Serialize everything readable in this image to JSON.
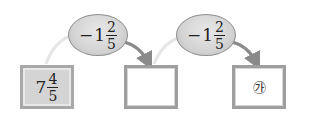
{
  "diagram": {
    "start_box": {
      "whole": "7",
      "numerator": "4",
      "denominator": "5"
    },
    "operations": [
      {
        "sign": "−",
        "whole": "1",
        "numerator": "2",
        "denominator": "5"
      },
      {
        "sign": "−",
        "whole": "1",
        "numerator": "2",
        "denominator": "5"
      }
    ],
    "middle_box": {
      "value": ""
    },
    "result_box": {
      "label": "㉮"
    },
    "colors": {
      "box_fill": "#d4d4d4",
      "box_border": "#9e9e9e",
      "oval_fill": "#d4d4d4",
      "arrow": "#8a8a8a",
      "arc_light": "#e6e6e6"
    }
  }
}
